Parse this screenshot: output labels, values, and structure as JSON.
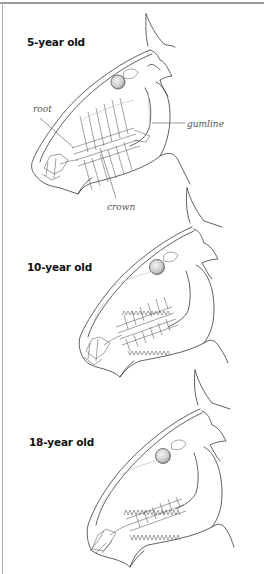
{
  "figure": {
    "stages": [
      {
        "label": "5-year old",
        "annotations": {
          "root": "root",
          "gumline": "gumline",
          "crown": "crown"
        }
      },
      {
        "label": "10-year old"
      },
      {
        "label": "18-year old"
      }
    ]
  }
}
